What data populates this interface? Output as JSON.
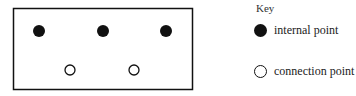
{
  "diagram": {
    "frame": {
      "x": 13,
      "y": 8,
      "width": 180,
      "height": 82
    },
    "internal_points": [
      {
        "cx": 39,
        "cy": 31
      },
      {
        "cx": 103,
        "cy": 31
      },
      {
        "cx": 166,
        "cy": 31
      }
    ],
    "connection_points": [
      {
        "cx": 70,
        "cy": 70
      },
      {
        "cx": 134,
        "cy": 70
      }
    ],
    "colors": {
      "stroke": "#111111",
      "fill": "#111111",
      "background": "#ffffff"
    }
  },
  "key": {
    "title": "Key",
    "items": [
      {
        "symbol": "filled-circle",
        "label": "internal point"
      },
      {
        "symbol": "open-circle",
        "label": "connection point"
      }
    ]
  }
}
